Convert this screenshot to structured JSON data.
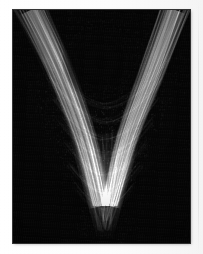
{
  "figure": {
    "title": "",
    "caption": "",
    "kind": "density-image"
  },
  "canvas": {
    "width": 203,
    "height": 254,
    "margin_color": "#ffffff",
    "panel": {
      "x": 13,
      "y": 10,
      "width": 177,
      "height": 233,
      "background_color": "#050505",
      "border_color": "#141414"
    }
  },
  "palette": {
    "background": "#050505",
    "low": "#0a0a0a",
    "mid": "#6a6a6a",
    "high": "#c8c8c8",
    "peak": "#e6e6e6",
    "paper": "#ffffff"
  },
  "chart_data": {
    "type": "heatmap",
    "title": "",
    "xlabel": "",
    "ylabel": "",
    "xlim": [
      0,
      177
    ],
    "ylim": [
      0,
      233
    ],
    "grid": false,
    "legend": "none",
    "colormap": "grayscale",
    "value_range": [
      0,
      1
    ],
    "structures": [
      {
        "name": "left-arm",
        "role": "bright caustic branch descending from upper-left to bottom-center",
        "points": [
          [
            18,
            0
          ],
          [
            46,
            60
          ],
          [
            72,
            130
          ],
          [
            88,
            196
          ]
        ],
        "peak_intensity": 0.74,
        "width_top": 34,
        "width_bottom": 16
      },
      {
        "name": "right-arm",
        "role": "bright caustic branch descending from upper-right to bottom-center",
        "points": [
          [
            162,
            0
          ],
          [
            140,
            60
          ],
          [
            114,
            130
          ],
          [
            97,
            196
          ]
        ],
        "peak_intensity": 0.86,
        "width_top": 30,
        "width_bottom": 14
      },
      {
        "name": "central-cone",
        "role": "convergence cone / focal tip at bottom center",
        "apex": [
          92,
          222
        ],
        "top_width": 48,
        "peak_intensity": 0.62
      },
      {
        "name": "inner-arcs",
        "role": "nested parabolic arcs crossing between the two arms",
        "count": 7,
        "vertex_y_values": [
          96,
          112,
          128,
          146,
          164,
          182,
          198
        ],
        "peak_intensity": 0.45
      },
      {
        "name": "central-void",
        "role": "dark low-density region between the arms near the top",
        "center": [
          88,
          52
        ],
        "radius": 42,
        "intensity": 0.03
      }
    ],
    "filaments": {
      "count": 150,
      "description": "fine individual trajectory streaks following the caustic envelope",
      "intensity_range": [
        0.2,
        0.95
      ]
    }
  }
}
